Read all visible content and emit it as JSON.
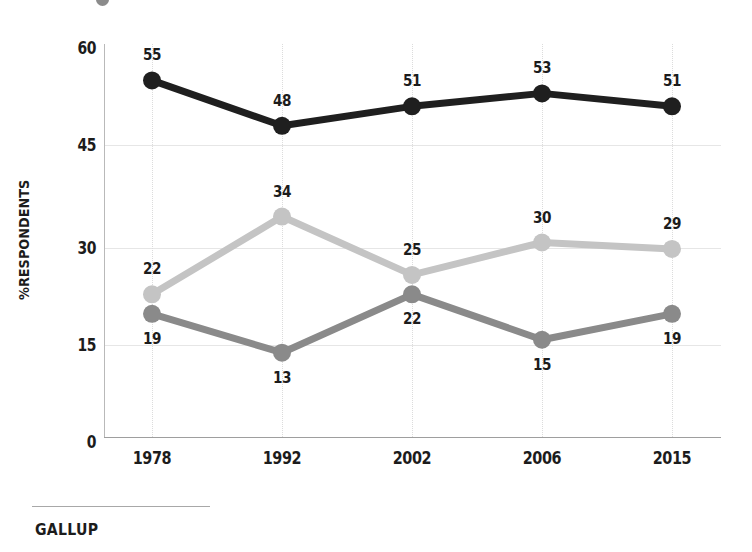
{
  "chart_data": {
    "type": "line",
    "title": "",
    "subtitle": "",
    "xlabel": "",
    "ylabel": "%RESPONDENTS",
    "categories": [
      "1978",
      "1992",
      "2002",
      "2006",
      "2015"
    ],
    "ylim": [
      0,
      60
    ],
    "yticks": [
      0,
      15,
      30,
      45,
      60
    ],
    "ytick_labels": [
      "0",
      "15",
      "30",
      "45",
      "60"
    ],
    "grid": "horizontal-and-vertical-faint",
    "legend": "none-visible",
    "series": [
      {
        "name": "series-black",
        "color": "#1f1f1f",
        "values": [
          55,
          48,
          51,
          53,
          51
        ],
        "labels": [
          "55",
          "48",
          "51",
          "53",
          "51"
        ],
        "label_position": "above"
      },
      {
        "name": "series-light-gray",
        "color": "#c4c4c4",
        "values": [
          22,
          34,
          25,
          30,
          29
        ],
        "labels": [
          "22",
          "34",
          "25",
          "30",
          "29"
        ],
        "label_position": "above"
      },
      {
        "name": "series-medium-gray",
        "color": "#8a8a8a",
        "values": [
          19,
          13,
          22,
          15,
          19
        ],
        "labels": [
          "19",
          "13",
          "22",
          "15",
          "19"
        ],
        "label_position": "below"
      }
    ]
  },
  "footer": {
    "brand": "GALLUP"
  },
  "colors": {
    "black_series": "#1f1f1f",
    "light_gray_series": "#c4c4c4",
    "medium_gray_series": "#8a8a8a",
    "gridline": "#e6e6e6",
    "axis": "#9e9e9e",
    "text": "#1c1c1c",
    "background": "#ffffff"
  }
}
